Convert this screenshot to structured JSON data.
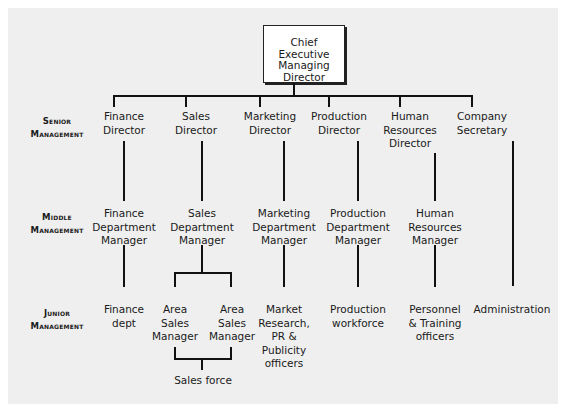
{
  "top": {
    "line1": "Chief Executive",
    "line2": "Managing Director"
  },
  "levels": [
    {
      "id": "senior",
      "line1": "Senior",
      "line2": "Management"
    },
    {
      "id": "middle",
      "line1": "Middle",
      "line2": "Management"
    },
    {
      "id": "junior",
      "line1": "Junior",
      "line2": "Management"
    }
  ],
  "senior": [
    {
      "id": "finance",
      "lines": [
        "Finance",
        "Director"
      ]
    },
    {
      "id": "sales",
      "lines": [
        "Sales",
        "Director"
      ]
    },
    {
      "id": "marketing",
      "lines": [
        "Marketing",
        "Director"
      ]
    },
    {
      "id": "production",
      "lines": [
        "Production",
        "Director"
      ]
    },
    {
      "id": "hr",
      "lines": [
        "Human",
        "Resources",
        "Director"
      ]
    },
    {
      "id": "company-secretary",
      "lines": [
        "Company",
        "Secretary"
      ]
    }
  ],
  "middle": [
    {
      "id": "finance",
      "lines": [
        "Finance",
        "Department",
        "Manager"
      ]
    },
    {
      "id": "sales",
      "lines": [
        "Sales",
        "Department",
        "Manager"
      ]
    },
    {
      "id": "marketing",
      "lines": [
        "Marketing",
        "Department",
        "Manager"
      ]
    },
    {
      "id": "production",
      "lines": [
        "Production",
        "Department",
        "Manager"
      ]
    },
    {
      "id": "hr",
      "lines": [
        "Human",
        "Resources",
        "Manager"
      ]
    }
  ],
  "junior": [
    {
      "id": "finance",
      "lines": [
        "Finance",
        "dept"
      ]
    },
    {
      "id": "area-sales-1",
      "lines": [
        "Area",
        "Sales",
        "Manager"
      ]
    },
    {
      "id": "area-sales-2",
      "lines": [
        "Area",
        "Sales",
        "Manager"
      ]
    },
    {
      "id": "marketing",
      "lines": [
        "Market",
        "Research,",
        "PR &",
        "Publicity",
        "officers"
      ]
    },
    {
      "id": "production",
      "lines": [
        "Production",
        "workforce"
      ]
    },
    {
      "id": "hr",
      "lines": [
        "Personnel",
        "& Training",
        "officers"
      ]
    },
    {
      "id": "administration",
      "lines": [
        "Administration"
      ]
    }
  ],
  "sales_force": {
    "label": "Sales force"
  }
}
